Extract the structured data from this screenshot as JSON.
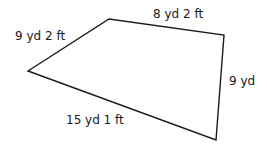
{
  "diagram": {
    "shape": "quadrilateral",
    "vertices": [
      [
        28,
        71
      ],
      [
        109,
        19
      ],
      [
        224,
        35
      ],
      [
        216,
        140
      ]
    ],
    "stroke_color": "#1a1a1a",
    "sides": [
      {
        "id": "top-left",
        "label": "9 yd 2 ft"
      },
      {
        "id": "top",
        "label": "8 yd 2 ft"
      },
      {
        "id": "right",
        "label": "9 yd"
      },
      {
        "id": "bottom",
        "label": "15 yd 1 ft"
      }
    ]
  }
}
